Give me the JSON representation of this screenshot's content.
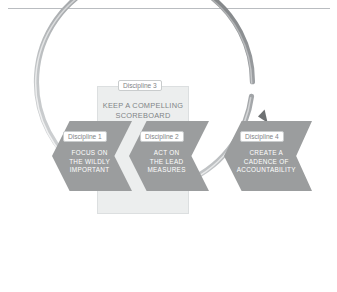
{
  "page": {
    "background_color": "#ffffff",
    "rule_color": "#b9bcc0"
  },
  "diagram": {
    "name": "4 Disciplines of Execution cycle",
    "colors": {
      "chevron_fill": "#9b9d9e",
      "panel_fill": "#eceeee",
      "panel_border": "#dcdfe0",
      "chip_fill": "#ffffff",
      "chip_border": "#c9cccd",
      "chip_text": "#7f8487",
      "chevron_text": "#ffffff",
      "panel_text": "#7f8487",
      "ring_light": "#d4d6d8",
      "ring_dark": "#6e7173"
    },
    "ring": {
      "name": "circular-arrow",
      "direction": "clockwise",
      "arrow_target": "Discipline 4"
    },
    "panel": {
      "chip_label": "Discipline 3",
      "heading": "KEEP A COMPELLING\nSCOREBOARD"
    },
    "chevrons": [
      {
        "chip_label": "Discipline 1",
        "text": "FOCUS ON\nTHE WILDLY\nIMPORTANT"
      },
      {
        "chip_label": "Discipline 2",
        "text": "ACT ON\nTHE LEAD\nMEASURES"
      },
      {
        "chip_label": "Discipline 4",
        "text": "CREATE A\nCADENCE OF\nACCOUNTABILITY"
      }
    ]
  }
}
